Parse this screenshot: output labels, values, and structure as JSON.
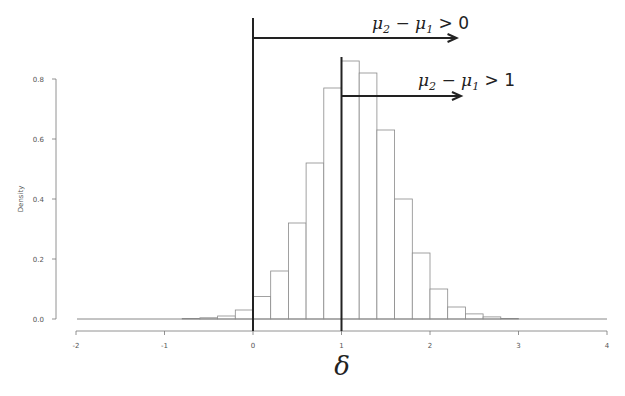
{
  "chart_data": {
    "type": "bar",
    "subtype": "histogram",
    "title": "",
    "xlabel": "δ",
    "ylabel": "Density",
    "xlim": [
      -2,
      4
    ],
    "ylim": [
      0,
      0.8
    ],
    "x_ticks": [
      "-2",
      "-1",
      "0",
      "1",
      "2",
      "3",
      "4"
    ],
    "y_ticks": [
      "0.0",
      "0.2",
      "0.4",
      "0.6",
      "0.8"
    ],
    "bin_width": 0.2,
    "bin_left_edges": [
      -0.8,
      -0.6,
      -0.4,
      -0.2,
      0.0,
      0.2,
      0.4,
      0.6,
      0.8,
      1.0,
      1.2,
      1.4,
      1.6,
      1.8,
      2.0,
      2.2,
      2.4,
      2.6,
      2.8
    ],
    "values": [
      0.002,
      0.004,
      0.01,
      0.03,
      0.075,
      0.16,
      0.32,
      0.52,
      0.77,
      0.86,
      0.82,
      0.63,
      0.4,
      0.22,
      0.1,
      0.04,
      0.017,
      0.007,
      0.002
    ],
    "grid": false,
    "legend": null,
    "annotations": [
      {
        "type": "vline",
        "x": 0,
        "arrow_to_x": 2.3,
        "label": "μ2 − μ1 > 0",
        "label_main": "μ",
        "sub1": "2",
        "mid": " − μ",
        "sub2": "1",
        "rel": " > 0"
      },
      {
        "type": "vline",
        "x": 1,
        "arrow_to_x": 2.35,
        "label": "μ2 − μ1 > 1",
        "label_main": "μ",
        "sub1": "2",
        "mid": " − μ",
        "sub2": "1",
        "rel": " > 1"
      }
    ]
  },
  "colors": {
    "bar_fill": "#ffffff",
    "bar_stroke": "#8a8a8a",
    "axis": "#777777",
    "annotation_line": "#222222"
  }
}
